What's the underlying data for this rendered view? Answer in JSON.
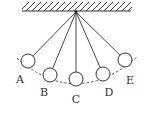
{
  "diagram": {
    "type": "pendulum-positions",
    "colors": {
      "stroke": "#333333",
      "background": "#ffffff"
    },
    "pivot": {
      "x": 76,
      "y": 12
    },
    "ceiling": {
      "x1": 22,
      "x2": 131,
      "y": 11
    },
    "positions": [
      {
        "label": "A",
        "ball": {
          "cx": 28,
          "cy": 61
        },
        "label_pos": {
          "x": 20,
          "y": 83
        }
      },
      {
        "label": "B",
        "ball": {
          "cx": 50,
          "cy": 75
        },
        "label_pos": {
          "x": 44,
          "y": 96
        }
      },
      {
        "label": "C",
        "ball": {
          "cx": 76,
          "cy": 79
        },
        "label_pos": {
          "x": 76,
          "y": 103
        }
      },
      {
        "label": "D",
        "ball": {
          "cx": 103,
          "cy": 74
        },
        "label_pos": {
          "x": 109,
          "y": 96
        }
      },
      {
        "label": "E",
        "ball": {
          "cx": 125,
          "cy": 60
        },
        "label_pos": {
          "x": 130,
          "y": 84
        }
      }
    ],
    "ball_radius": 7,
    "path": "dashed-arc"
  }
}
